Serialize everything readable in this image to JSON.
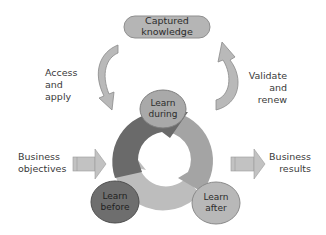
{
  "diagram": {
    "title": "",
    "top_node": {
      "label_line1": "Captured",
      "label_line2": "knowledge"
    },
    "left_flow": {
      "label_line1": "Access",
      "label_line2": "and",
      "label_line3": "apply"
    },
    "right_flow": {
      "label_line1": "Validate",
      "label_line2": "and",
      "label_line3": "renew"
    },
    "input": {
      "label_line1": "Business",
      "label_line2": "objectives"
    },
    "output": {
      "label_line1": "Business",
      "label_line2": "results"
    },
    "cycle_nodes": [
      {
        "id": "during",
        "label_line1": "Learn",
        "label_line2": "during",
        "color": "#a9a9a9"
      },
      {
        "id": "before",
        "label_line1": "Learn",
        "label_line2": "before",
        "color": "#6e6e6e"
      },
      {
        "id": "after",
        "label_line1": "Learn",
        "label_line2": "after",
        "color": "#b8b8b8"
      }
    ],
    "colors": {
      "top_pill": "#b5b5b5",
      "curved_arrows": "#b9b9b9",
      "ring_dark": "#6a6a6a",
      "ring_mid": "#a2a2a2",
      "ring_light": "#bdbdbd",
      "io_arrows": "#c2c2c2"
    }
  }
}
